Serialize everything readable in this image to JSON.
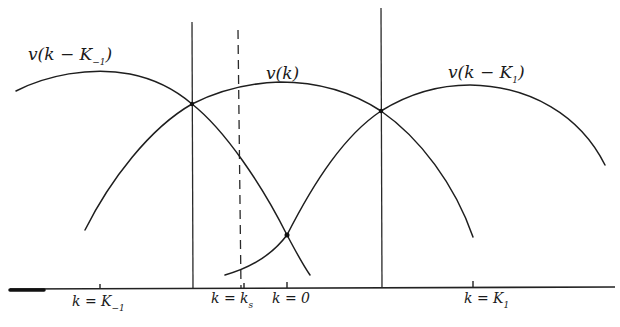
{
  "diagram": {
    "curves": [
      {
        "id": "v_k_minus_K_minus1",
        "label_main": "v(k − K",
        "label_sub": "−1",
        "label_close": ")",
        "center_tick": "K_-1"
      },
      {
        "id": "v_k",
        "label_main": "v(k)",
        "center_tick": "0"
      },
      {
        "id": "v_k_minus_K1",
        "label_main": "v(k − K",
        "label_sub": "1",
        "label_close": ")",
        "center_tick": "K_1"
      }
    ],
    "axis": {
      "ticks": [
        {
          "label_main": "k = K",
          "label_sub": "−1",
          "x": 100
        },
        {
          "label_main": "k = k",
          "label_sub": "s",
          "x": 240
        },
        {
          "label_main": "k = 0",
          "label_sub": "",
          "x": 287
        },
        {
          "label_main": "k = K",
          "label_sub": "1",
          "x": 473
        }
      ]
    },
    "vertical_lines": [
      {
        "style": "solid",
        "x": 192,
        "meaning": "crossing of v(k−K_-1) and v(k)"
      },
      {
        "style": "dashed",
        "x": 240,
        "meaning": "k = k_s"
      },
      {
        "style": "solid",
        "x": 381,
        "meaning": "crossing of v(k) and v(k−K_1)"
      }
    ],
    "colors": {
      "ink": "#1e1e1e",
      "paper": "#ffffff"
    }
  }
}
